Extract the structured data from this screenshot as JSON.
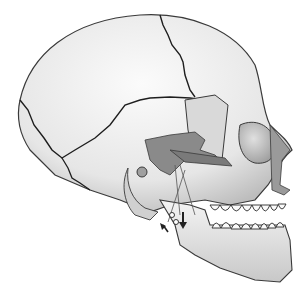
{
  "illustration": {
    "subject": "skull-lateral-view",
    "style": "grayscale",
    "colors": {
      "background": "#ffffff",
      "bone_light": "#f2f2f2",
      "bone_shade": "#bdbdbd",
      "outline": "#3a3a3a",
      "suture": "#1e1e1e",
      "cutaway_gray": "#8a8a8a",
      "teeth": "#fafafa"
    },
    "features": [
      "cranium",
      "sutures",
      "orbit",
      "nasal-bone",
      "zygomatic-arch",
      "ear-canal",
      "mandible",
      "teeth",
      "jaw-joint-arrows"
    ]
  }
}
